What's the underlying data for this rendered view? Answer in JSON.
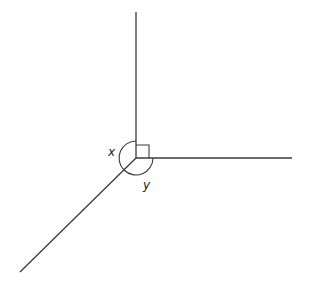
{
  "diagram": {
    "type": "angles-at-a-point",
    "vertex": {
      "x": 136,
      "y": 158
    },
    "rays": [
      {
        "name": "up",
        "x2": 136,
        "y2": 12
      },
      {
        "name": "right",
        "x2": 292,
        "y2": 158
      },
      {
        "name": "down-left",
        "x2": 20,
        "y2": 272
      }
    ],
    "right_angle_marker": true,
    "labels": {
      "x": "x",
      "y": "y"
    },
    "colors": {
      "stroke": "#3a3a3a",
      "background": "#ffffff"
    }
  }
}
